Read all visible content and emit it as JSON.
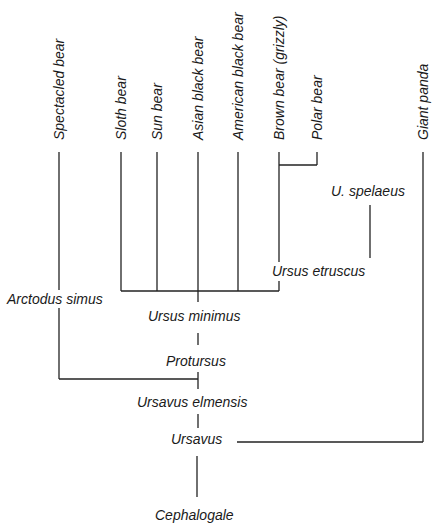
{
  "diagram": {
    "type": "phylogenetic-tree",
    "title": "",
    "extant_species": [
      {
        "id": "spectacled",
        "label": "Spectacled bear",
        "x": 59
      },
      {
        "id": "sloth",
        "label": "Sloth bear",
        "x": 121
      },
      {
        "id": "sun",
        "label": "Sun bear",
        "x": 157
      },
      {
        "id": "asian",
        "label": "Asian black bear",
        "x": 198
      },
      {
        "id": "american",
        "label": "American black bear",
        "x": 238
      },
      {
        "id": "brown",
        "label": "Brown bear (grizzly)",
        "x": 279
      },
      {
        "id": "polar",
        "label": "Polar bear",
        "x": 317
      },
      {
        "id": "panda",
        "label": "Giant panda",
        "x": 423
      }
    ],
    "fossil_nodes": [
      {
        "id": "spelaeus",
        "label": "U. spelaeus"
      },
      {
        "id": "etruscus",
        "label": "Ursus etruscus"
      },
      {
        "id": "arctodus",
        "label": "Arctodus simus"
      },
      {
        "id": "minimus",
        "label": "Ursus minimus"
      },
      {
        "id": "protursus",
        "label": "Protursus"
      },
      {
        "id": "elmensis",
        "label": "Ursavus elmensis"
      },
      {
        "id": "ursavus",
        "label": "Ursavus"
      },
      {
        "id": "cephalogale",
        "label": "Cephalogale"
      }
    ],
    "edges": [
      [
        "Cephalogale",
        "Ursavus"
      ],
      [
        "Ursavus",
        "Giant panda"
      ],
      [
        "Ursavus",
        "Ursavus elmensis"
      ],
      [
        "Ursavus elmensis",
        "Protursus"
      ],
      [
        "Ursavus elmensis",
        "Arctodus simus"
      ],
      [
        "Arctodus simus",
        "Spectacled bear"
      ],
      [
        "Protursus",
        "Ursus minimus"
      ],
      [
        "Ursus minimus",
        "Sloth bear"
      ],
      [
        "Ursus minimus",
        "Sun bear"
      ],
      [
        "Ursus minimus",
        "Asian black bear"
      ],
      [
        "Ursus minimus",
        "American black bear"
      ],
      [
        "Ursus minimus",
        "Ursus etruscus"
      ],
      [
        "Ursus etruscus",
        "U. spelaeus"
      ],
      [
        "Ursus etruscus",
        "Brown bear (grizzly)"
      ],
      [
        "Brown bear (grizzly)",
        "Polar bear"
      ]
    ],
    "line_color": "#222222",
    "background": "#ffffff"
  }
}
